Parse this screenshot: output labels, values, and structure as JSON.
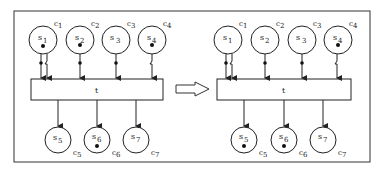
{
  "figure": {
    "frame_color": "#333333",
    "stroke_color": "#222222"
  },
  "panels": [
    {
      "id": "before",
      "transition_label": "t",
      "input_places": [
        {
          "label": "s1",
          "sub": "1",
          "cap": "c1",
          "token": true
        },
        {
          "label": "s2",
          "sub": "2",
          "cap": "c2",
          "token": true
        },
        {
          "label": "s3",
          "sub": "3",
          "cap": "c3",
          "token": false
        },
        {
          "label": "s4",
          "sub": "4",
          "cap": "c4",
          "token": true
        }
      ],
      "output_places": [
        {
          "label": "s5",
          "sub": "5",
          "cap": "c5",
          "token": false
        },
        {
          "label": "s6",
          "sub": "6",
          "cap": "c6",
          "token": true
        },
        {
          "label": "s7",
          "sub": "7",
          "cap": "c7",
          "token": false
        }
      ]
    },
    {
      "id": "after",
      "transition_label": "t",
      "input_places": [
        {
          "label": "s1",
          "sub": "1",
          "cap": "c1",
          "token": false
        },
        {
          "label": "s2",
          "sub": "2",
          "cap": "c2",
          "token": false
        },
        {
          "label": "s3",
          "sub": "3",
          "cap": "c3",
          "token": false
        },
        {
          "label": "s4",
          "sub": "4",
          "cap": "c4",
          "token": true
        }
      ],
      "output_places": [
        {
          "label": "s5",
          "sub": "5",
          "cap": "c5",
          "token": true
        },
        {
          "label": "s6",
          "sub": "6",
          "cap": "c6",
          "token": true
        },
        {
          "label": "s7",
          "sub": "7",
          "cap": "c7",
          "token": false
        }
      ]
    }
  ],
  "labels": {
    "s": "s",
    "c": "c",
    "t_left": "t",
    "t_right": "t",
    "L": {
      "s1": "1",
      "s2": "2",
      "s3": "3",
      "s4": "4",
      "s5": "5",
      "s6": "6",
      "s7": "7",
      "c1": "1",
      "c2": "2",
      "c3": "3",
      "c4": "4",
      "c5": "5",
      "c6": "6",
      "c7": "7"
    },
    "R": {
      "s1": "1",
      "s2": "2",
      "s3": "3",
      "s4": "4",
      "s5": "5",
      "s6": "6",
      "s7": "7",
      "c1": "1",
      "c2": "2",
      "c3": "3",
      "c4": "4",
      "c5": "5",
      "c6": "6",
      "c7": "7"
    }
  },
  "transition_arrow": {
    "icon": "hollow-right-arrow"
  }
}
